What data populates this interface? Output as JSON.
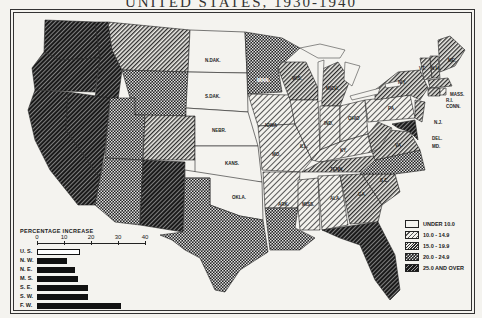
{
  "title": "UNITED STATES, 1930-1940",
  "legend": {
    "items": [
      {
        "label": "UNDER 10.0",
        "pattern": "blank"
      },
      {
        "label": "10.0 - 14.9",
        "pattern": "light-diagonal"
      },
      {
        "label": "15.0 - 19.9",
        "pattern": "medium-diagonal"
      },
      {
        "label": "20.0 - 24.9",
        "pattern": "crosshatch"
      },
      {
        "label": "25.0 AND OVER",
        "pattern": "dense-diagonal"
      }
    ]
  },
  "states": [
    {
      "abbr": "WASH.",
      "category": 4
    },
    {
      "abbr": "ORE.",
      "category": 4
    },
    {
      "abbr": "CALIF.",
      "category": 4
    },
    {
      "abbr": "NEV.",
      "category": 4
    },
    {
      "abbr": "IDAHO",
      "category": 4
    },
    {
      "abbr": "MONT.",
      "category": 2
    },
    {
      "abbr": "WYO.",
      "category": 3
    },
    {
      "abbr": "UTAH",
      "category": 3
    },
    {
      "abbr": "COLO.",
      "category": 2
    },
    {
      "abbr": "ARIZ.",
      "category": 3
    },
    {
      "abbr": "N.MEX.",
      "category": 4
    },
    {
      "abbr": "N.DAK.",
      "category": 0
    },
    {
      "abbr": "S.DAK.",
      "category": 0
    },
    {
      "abbr": "NEBR.",
      "category": 0
    },
    {
      "abbr": "KANS.",
      "category": 0
    },
    {
      "abbr": "OKLA.",
      "category": 0
    },
    {
      "abbr": "TEX.",
      "category": 3
    },
    {
      "abbr": "MINN.",
      "category": 3
    },
    {
      "abbr": "IOWA",
      "category": 1
    },
    {
      "abbr": "MO.",
      "category": 1
    },
    {
      "abbr": "ARK.",
      "category": 1
    },
    {
      "abbr": "LA.",
      "category": 3
    },
    {
      "abbr": "WIS.",
      "category": 2
    },
    {
      "abbr": "ILL.",
      "category": 1
    },
    {
      "abbr": "MISS.",
      "category": 1
    },
    {
      "abbr": "MICH.",
      "category": 2
    },
    {
      "abbr": "IND.",
      "category": 1
    },
    {
      "abbr": "KY.",
      "category": 1
    },
    {
      "abbr": "TENN.",
      "category": 2
    },
    {
      "abbr": "ALA.",
      "category": 1
    },
    {
      "abbr": "OHIO",
      "category": 1
    },
    {
      "abbr": "W.VA.",
      "category": 2
    },
    {
      "abbr": "VA.",
      "category": 2
    },
    {
      "abbr": "N.C.",
      "category": 3
    },
    {
      "abbr": "S.C.",
      "category": 2
    },
    {
      "abbr": "GA.",
      "category": 2
    },
    {
      "abbr": "FLA.",
      "category": 4
    },
    {
      "abbr": "PA.",
      "category": 1
    },
    {
      "abbr": "N.Y.",
      "category": 2
    },
    {
      "abbr": "N.J.",
      "category": 2
    },
    {
      "abbr": "DEL.",
      "category": 2
    },
    {
      "abbr": "MD.",
      "category": 4
    },
    {
      "abbr": "CONN.",
      "category": 2
    },
    {
      "abbr": "R.I.",
      "category": 1
    },
    {
      "abbr": "MASS.",
      "category": 2
    },
    {
      "abbr": "VT.",
      "category": 2
    },
    {
      "abbr": "N.H.",
      "category": 2
    },
    {
      "abbr": "ME.",
      "category": 2
    }
  ],
  "chart_data": {
    "type": "bar",
    "orientation": "horizontal",
    "title": "PERCENTAGE INCREASE",
    "categories": [
      "U. S.",
      "N. W.",
      "N. E.",
      "M. S.",
      "S. E.",
      "S. W.",
      "F. W."
    ],
    "values": [
      16,
      11,
      14,
      15,
      19,
      19,
      31
    ],
    "xticks": [
      0,
      10,
      20,
      30,
      40
    ],
    "xlim": [
      0,
      40
    ],
    "xlabel": "",
    "ylabel": ""
  },
  "barchart": {
    "title": "PERCENTAGE INCREASE",
    "ticks": [
      "0",
      "10",
      "20",
      "30",
      "40"
    ],
    "rows": [
      {
        "label": "U. S.",
        "value": 16
      },
      {
        "label": "N. W.",
        "value": 11
      },
      {
        "label": "N. E.",
        "value": 14
      },
      {
        "label": "M. S.",
        "value": 15
      },
      {
        "label": "S. E.",
        "value": 19
      },
      {
        "label": "S. W.",
        "value": 19
      },
      {
        "label": "F. W.",
        "value": 31
      }
    ]
  },
  "labels": {
    "ndak": "N.DAK.",
    "sdak": "S.DAK.",
    "nebr": "NEBR.",
    "kans": "KANS.",
    "okla": "OKLA.",
    "iowa": "IOWA",
    "mo": "MO.",
    "ill": "ILL.",
    "ind": "IND.",
    "ohio": "OHIO",
    "pa": "PA.",
    "ny": "N.Y.",
    "ark": "ARK.",
    "miss": "MISS.",
    "ala": "ALA.",
    "ga": "GA.",
    "sc": "S.C.",
    "tenn": "TENN.",
    "ky": "KY.",
    "va": "VA.",
    "wis": "WIS.",
    "mich": "MICH.",
    "minn": "MINN.",
    "mass": "MASS.",
    "ri": "R.I.",
    "conn": "CONN.",
    "nj": "N.J.",
    "del": "DEL.",
    "md": "MD.",
    "vt": "VT.",
    "nh": "N.H.",
    "me": "ME."
  }
}
